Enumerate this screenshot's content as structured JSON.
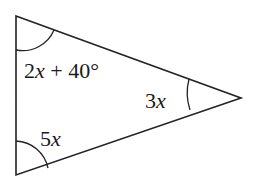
{
  "figure": {
    "type": "triangle",
    "stroke_color": "#222222",
    "vertices": {
      "top": {
        "x": 16,
        "y": 16
      },
      "right": {
        "x": 241,
        "y": 98
      },
      "bottom": {
        "x": 16,
        "y": 175
      }
    },
    "angles": {
      "top": {
        "coef": "2",
        "var": "x",
        "rest": " + 40°"
      },
      "right": {
        "coef": "3",
        "var": "x"
      },
      "bottom": {
        "coef": "5",
        "var": "x"
      }
    }
  }
}
